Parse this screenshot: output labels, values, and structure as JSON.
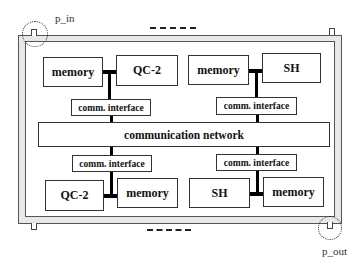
{
  "diagram": {
    "ports": {
      "input_label": "p_in",
      "output_label": "p_out"
    },
    "network": {
      "label": "communication network"
    },
    "nodes": [
      {
        "position": "top-left",
        "left_label": "memory",
        "right_label": "QC-2",
        "interface_label": "comm. interface"
      },
      {
        "position": "top-right",
        "left_label": "memory",
        "right_label": "SH",
        "interface_label": "comm. interface"
      },
      {
        "position": "bottom-left",
        "left_label": "QC-2",
        "right_label": "memory",
        "interface_label": "comm. interface"
      },
      {
        "position": "bottom-right",
        "left_label": "SH",
        "right_label": "memory",
        "interface_label": "comm. interface"
      }
    ],
    "colors": {
      "line": "#000000",
      "frame_fill": "#e8e8e8",
      "box_border": "#333333"
    }
  }
}
